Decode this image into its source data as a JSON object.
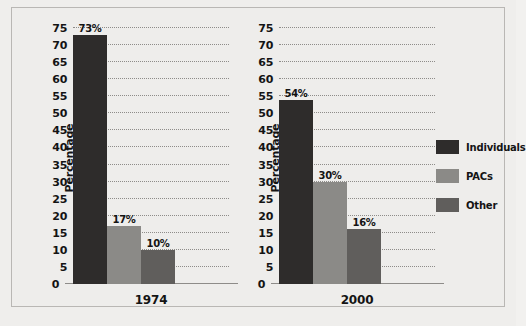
{
  "chart_data": {
    "type": "bar",
    "title": "",
    "xlabel": "",
    "ylabel": "Percentage",
    "ylim": [
      0,
      75
    ],
    "ytick_step": 5,
    "yticks": [
      "0",
      "5",
      "10",
      "15",
      "20",
      "25",
      "30",
      "35",
      "40",
      "45",
      "50",
      "55",
      "60",
      "65",
      "70",
      "75"
    ],
    "grid": "horizontal-dotted",
    "legend_position": "right",
    "categories": [
      "1974",
      "2000"
    ],
    "series": [
      {
        "name": "Individuals",
        "color": "#2e2c2b",
        "values": [
          73,
          54
        ],
        "labels": [
          "73%",
          "54%"
        ]
      },
      {
        "name": "PACs",
        "color": "#8b8a87",
        "values": [
          17,
          30
        ],
        "labels": [
          "17%",
          "30%"
        ]
      },
      {
        "name": "Other",
        "color": "#605e5c",
        "values": [
          10,
          16
        ],
        "labels": [
          "10%",
          "16%"
        ]
      }
    ],
    "panels": [
      {
        "x_label": "1974",
        "bars": [
          {
            "series": "Individuals",
            "value": 73,
            "label": "73%",
            "color": "#2e2c2b"
          },
          {
            "series": "PACs",
            "value": 17,
            "label": "17%",
            "color": "#8b8a87"
          },
          {
            "series": "Other",
            "value": 10,
            "label": "10%",
            "color": "#605e5c"
          }
        ]
      },
      {
        "x_label": "2000",
        "bars": [
          {
            "series": "Individuals",
            "value": 54,
            "label": "54%",
            "color": "#2e2c2b"
          },
          {
            "series": "PACs",
            "value": 30,
            "label": "30%",
            "color": "#8b8a87"
          },
          {
            "series": "Other",
            "value": 16,
            "label": "16%",
            "color": "#605e5c"
          }
        ]
      }
    ]
  },
  "legend": {
    "items": [
      {
        "label": "Individuals",
        "color": "#2e2c2b"
      },
      {
        "label": "PACs",
        "color": "#8b8a87"
      },
      {
        "label": "Other",
        "color": "#605e5c"
      }
    ]
  },
  "colors": {
    "background": "#efeeec",
    "frame_border": "#b9b7b4",
    "gridline": "#8e8c89",
    "axis": "#8e8c89",
    "text": "#141414"
  }
}
